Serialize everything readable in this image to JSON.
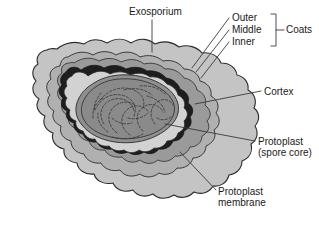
{
  "figure": {
    "background_color": "#ffffff",
    "width": 319,
    "height": 227
  },
  "labels": {
    "exosporium": "Exosporium",
    "outer": "Outer",
    "middle": "Middle",
    "inner": "Inner",
    "coats": "Coats",
    "cortex": "Cortex",
    "protoplast": "Protoplast",
    "protoplast_sub": "(spore core)",
    "protoplast_membrane_line1": "Protoplast",
    "protoplast_membrane_line2": "membrane"
  },
  "structures": [
    {
      "name": "exosporium",
      "label": "Exosporium",
      "description": "outermost wavy scalloped envelope",
      "color": "#c4c4c4",
      "stroke": "#2b2b2b"
    },
    {
      "name": "outer-coat",
      "label": "Outer",
      "group": "Coats",
      "color": "#b0b0b0",
      "stroke": "#2b2b2b"
    },
    {
      "name": "middle-coat",
      "label": "Middle",
      "group": "Coats",
      "color": "#9a9a9a",
      "stroke": "#2b2b2b"
    },
    {
      "name": "inner-coat",
      "label": "Inner",
      "group": "Coats",
      "color": "#1e1e1e",
      "stroke": "#111111"
    },
    {
      "name": "cortex",
      "label": "Cortex",
      "color": "#d2d2d2",
      "stroke": "#2b2b2b"
    },
    {
      "name": "protoplast-membrane",
      "label": "Protoplast membrane",
      "color": "#8f8f8f",
      "stroke": "#2b2b2b"
    },
    {
      "name": "protoplast",
      "label": "Protoplast (spore core)",
      "color": "#8a8a8a",
      "stroke": "#2b2b2b"
    }
  ],
  "colors": {
    "exosporium": "#c4c4c4",
    "outer_coat": "#b0b0b0",
    "middle_coat": "#9a9a9a",
    "inner_coat": "#1e1e1e",
    "cortex": "#d2d2d2",
    "core": "#8a8a8a",
    "nucleoid": "#3a3a3a",
    "outline": "#2b2b2b",
    "text": "#1a1a1a",
    "leader": "#3a3a3a"
  }
}
